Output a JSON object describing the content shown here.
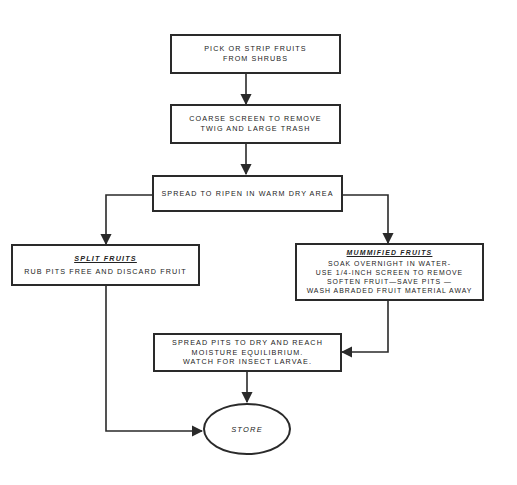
{
  "diagram": {
    "type": "flowchart",
    "line_color": "#2a2a2a",
    "nodes": [
      {
        "id": "pick",
        "lines": [
          "PICK OR STRIP FRUITS",
          "FROM SHRUBS"
        ]
      },
      {
        "id": "coarse_screen",
        "lines": [
          "COARSE SCREEN TO REMOVE",
          "TWIG AND LARGE TRASH"
        ]
      },
      {
        "id": "spread_ripen",
        "lines": [
          "SPREAD TO RIPEN IN WARM DRY AREA"
        ]
      },
      {
        "id": "split_fruits",
        "heading": "SPLIT  FRUITS",
        "lines": [
          "RUB PITS FREE AND DISCARD FRUIT"
        ]
      },
      {
        "id": "mummified_fruits",
        "heading": "MUMMIFIED FRUITS",
        "lines": [
          "SOAK OVERNIGHT IN WATER-",
          "USE 1/4-INCH SCREEN TO REMOVE",
          "SOFTEN FRUIT—SAVE PITS —",
          "WASH ABRADED FRUIT MATERIAL AWAY"
        ]
      },
      {
        "id": "spread_dry",
        "lines": [
          "SPREAD PITS TO DRY AND REACH",
          "MOISTURE EQUILIBRIUM.",
          "WATCH FOR INSECT LARVAE."
        ]
      },
      {
        "id": "store",
        "shape": "ellipse",
        "label": "STORE"
      }
    ],
    "edges": [
      {
        "from": "pick",
        "to": "coarse_screen"
      },
      {
        "from": "coarse_screen",
        "to": "spread_ripen"
      },
      {
        "from": "spread_ripen",
        "to": "split_fruits"
      },
      {
        "from": "spread_ripen",
        "to": "mummified_fruits"
      },
      {
        "from": "mummified_fruits",
        "to": "spread_dry"
      },
      {
        "from": "spread_dry",
        "to": "store"
      },
      {
        "from": "split_fruits",
        "to": "store"
      }
    ]
  }
}
